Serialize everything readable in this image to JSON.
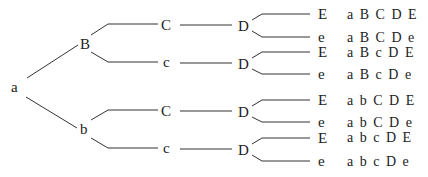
{
  "diagram": {
    "title": "",
    "nodes": {
      "root": "a",
      "B": "B",
      "b": "b",
      "C_upper": "C",
      "c_upper": "c",
      "C_lower": "C",
      "c_lower": "c",
      "D1": "D",
      "D2": "D",
      "D3": "D",
      "D4": "D"
    },
    "leaves": [
      {
        "allele": "E",
        "genotype": "a B C D E"
      },
      {
        "allele": "e",
        "genotype": "a B C D e"
      },
      {
        "allele": "E",
        "genotype": "a B c D E"
      },
      {
        "allele": "e",
        "genotype": "a B c D e"
      },
      {
        "allele": "E",
        "genotype": "a b C D E"
      },
      {
        "allele": "e",
        "genotype": "a b C D e"
      },
      {
        "allele": "E",
        "genotype": "a b c D E"
      },
      {
        "allele": "e",
        "genotype": "a b c D e"
      }
    ],
    "colors": {
      "line": "#333333",
      "text": "#222222",
      "background": "#ffffff"
    }
  }
}
